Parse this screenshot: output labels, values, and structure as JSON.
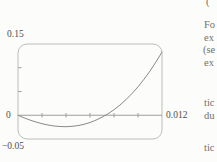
{
  "figure": {
    "labels": {
      "y_max": "0.15",
      "origin": "0",
      "x_max": "0.012",
      "y_min": "−0.05"
    }
  },
  "colors": {
    "page_background": "#fcfcfa",
    "frame": "#bdbdbd",
    "axis": "#9e9e9e",
    "curve": "#8a8a8a",
    "label_text": "#4e4e4e",
    "fragment_text": "#73716a"
  },
  "chart_data": {
    "type": "line",
    "title": "",
    "xlabel": "",
    "ylabel": "",
    "x_range": [
      0,
      0.012
    ],
    "y_range": [
      -0.05,
      0.15
    ],
    "x_tick_step": 0.002,
    "y_tick_step": 0.05,
    "grid": false,
    "legend": false,
    "frame_style": "rounded-calculator-viewing-window",
    "axis_tick_labels": [
      "0.15",
      "0",
      "0.012",
      "−0.05"
    ],
    "series": [
      {
        "name": "curve",
        "x": [
          0,
          0.0005,
          0.001,
          0.0015,
          0.002,
          0.0025,
          0.003,
          0.0035,
          0.004,
          0.0045,
          0.005,
          0.0055,
          0.006,
          0.0065,
          0.007,
          0.0075,
          0.008,
          0.0085,
          0.009,
          0.0095,
          0.01,
          0.0105,
          0.011,
          0.0115,
          0.012
        ],
        "y": [
          0,
          -0.0054,
          -0.0102,
          -0.0143,
          -0.0178,
          -0.0206,
          -0.0226,
          -0.0237,
          -0.024,
          -0.0233,
          -0.0217,
          -0.019,
          -0.0152,
          -0.0103,
          -0.0042,
          0.0031,
          0.0117,
          0.0216,
          0.033,
          0.0458,
          0.06,
          0.0758,
          0.0932,
          0.1123,
          0.133
        ]
      }
    ]
  },
  "adjacent_text_fragments": [
    {
      "text": "("
    },
    {
      "text": "Fo"
    },
    {
      "text": "ex"
    },
    {
      "text": "(se"
    },
    {
      "text": "ex"
    },
    {
      "text": "tic"
    },
    {
      "text": "du"
    },
    {
      "text": "tic"
    }
  ]
}
